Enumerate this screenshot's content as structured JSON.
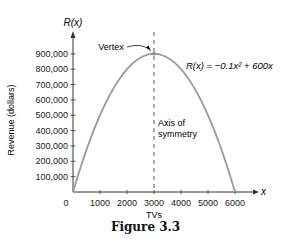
{
  "chart_data": {
    "type": "line",
    "title": "",
    "caption": "Figure 3.3",
    "xlabel": "TVs",
    "ylabel": "Revenue (dollars)",
    "x_axis_name": "x",
    "y_axis_name": "R(x)",
    "xlim": [
      0,
      6500
    ],
    "ylim": [
      0,
      1000000
    ],
    "x_ticks": [
      0,
      1000,
      2000,
      3000,
      4000,
      5000,
      6000
    ],
    "x_tick_labels": [
      "0",
      "1000",
      "2000",
      "3000",
      "4000",
      "5000",
      "6000"
    ],
    "y_ticks": [
      100000,
      200000,
      300000,
      400000,
      500000,
      600000,
      700000,
      800000,
      900000
    ],
    "y_tick_labels": [
      "100,000",
      "200,000",
      "300,000",
      "400,000",
      "500,000",
      "600,000",
      "700,000",
      "800,000",
      "900,000"
    ],
    "grid": false,
    "legend": null,
    "series": [
      {
        "name": "R(x) = −0.1x² + 600x",
        "x": [
          0,
          500,
          1000,
          1500,
          2000,
          2500,
          3000,
          3500,
          4000,
          4500,
          5000,
          5500,
          6000
        ],
        "values": [
          0,
          275000,
          500000,
          675000,
          800000,
          875000,
          900000,
          875000,
          800000,
          675000,
          500000,
          275000,
          0
        ],
        "color": "#9a9a9a"
      }
    ],
    "annotations": [
      {
        "text": "Vertex",
        "x": 3000,
        "y": 900000
      },
      {
        "text": "R(x) = −0.1x² + 600x",
        "type": "equation-label"
      },
      {
        "text": "Axis of symmetry",
        "x": 3000,
        "type": "dashed-vertical-line"
      }
    ]
  },
  "labels": {
    "y_axis_name": "R(x)",
    "x_axis_name": "x",
    "ylabel": "Revenue (dollars)",
    "xlabel": "TVs",
    "vertex": "Vertex",
    "equation": "R(x) = −0.1x² + 600x",
    "axis_line1": "Axis of",
    "axis_line2": "symmetry",
    "caption": "Figure 3.3"
  },
  "colors": {
    "curve": "#9a9a9a",
    "axis": "#333333",
    "text": "#222222",
    "dashed": "#555555"
  }
}
